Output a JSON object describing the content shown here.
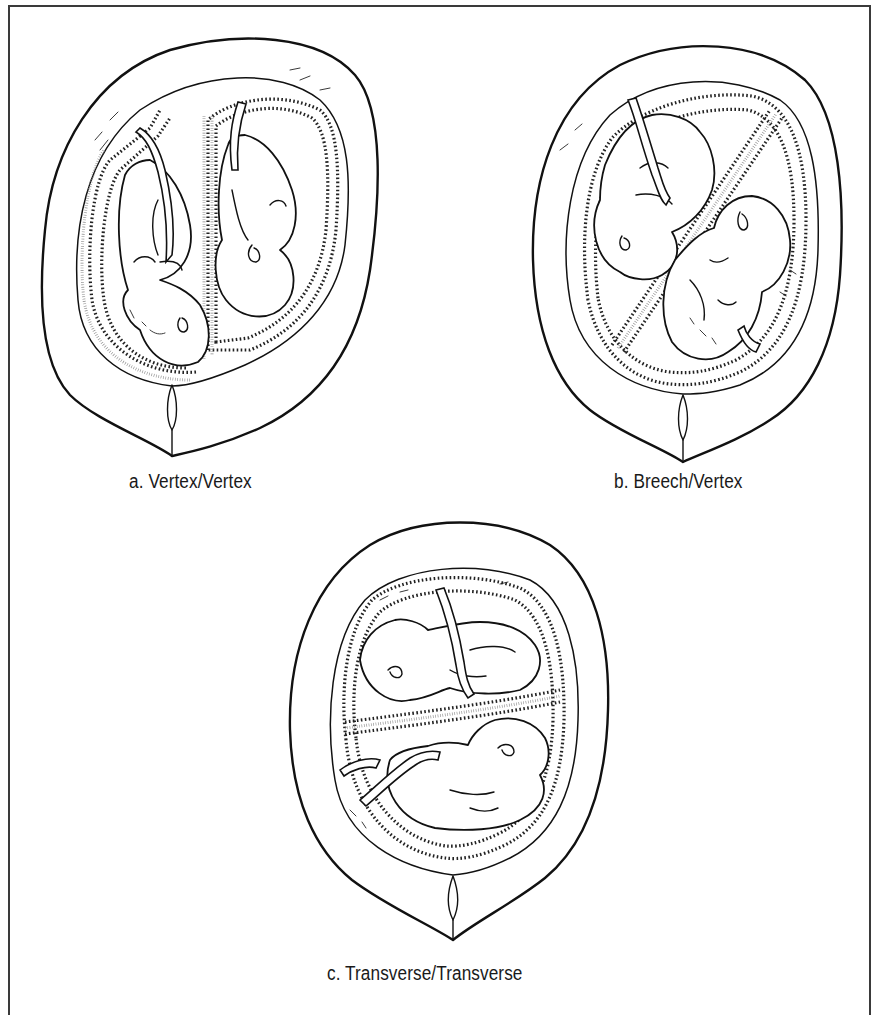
{
  "figure": {
    "panels": [
      {
        "id": "a",
        "caption": "a. Vertex/Vertex",
        "presentation": "vertex-vertex",
        "septum": "vertical"
      },
      {
        "id": "b",
        "caption": "b. Breech/Vertex",
        "presentation": "breech-vertex",
        "septum": "diagonal"
      },
      {
        "id": "c",
        "caption": "c. Transverse/Transverse",
        "presentation": "transverse-transverse",
        "septum": "horizontal"
      }
    ],
    "colors": {
      "ink": "#111111",
      "background": "#ffffff",
      "frame": "#3a3a3a"
    }
  }
}
